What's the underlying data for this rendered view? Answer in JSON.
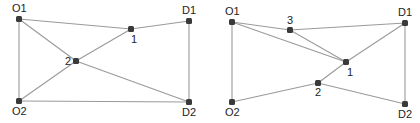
{
  "colors": {
    "edge": "#9a9a9a",
    "node": "#3a3a3a",
    "label": "#222222",
    "background": "#ffffff"
  },
  "diagrams": [
    {
      "id": "network-left",
      "nodes": [
        {
          "id": "O1",
          "label": "O1",
          "role": "origin"
        },
        {
          "id": "D1",
          "label": "D1",
          "role": "destination"
        },
        {
          "id": "1",
          "label": "1",
          "role": "intermediate"
        },
        {
          "id": "2",
          "label": "2",
          "role": "intermediate"
        },
        {
          "id": "O2",
          "label": "O2",
          "role": "origin"
        },
        {
          "id": "D2",
          "label": "D2",
          "role": "destination"
        }
      ],
      "edges": [
        [
          "O1",
          "1"
        ],
        [
          "1",
          "D1"
        ],
        [
          "O1",
          "2"
        ],
        [
          "2",
          "1"
        ],
        [
          "2",
          "O2"
        ],
        [
          "2",
          "D2"
        ],
        [
          "O1",
          "O2"
        ],
        [
          "D1",
          "D2"
        ],
        [
          "O2",
          "D2"
        ]
      ]
    },
    {
      "id": "network-right",
      "nodes": [
        {
          "id": "O1",
          "label": "O1",
          "role": "origin"
        },
        {
          "id": "D1",
          "label": "D1",
          "role": "destination"
        },
        {
          "id": "3",
          "label": "3",
          "role": "intermediate"
        },
        {
          "id": "1",
          "label": "1",
          "role": "intermediate"
        },
        {
          "id": "2",
          "label": "2",
          "role": "intermediate"
        },
        {
          "id": "O2",
          "label": "O2",
          "role": "origin"
        },
        {
          "id": "D2",
          "label": "D2",
          "role": "destination"
        }
      ],
      "edges": [
        [
          "O1",
          "3"
        ],
        [
          "3",
          "D1"
        ],
        [
          "O1",
          "1"
        ],
        [
          "3",
          "1"
        ],
        [
          "1",
          "D1"
        ],
        [
          "1",
          "2"
        ],
        [
          "2",
          "O2"
        ],
        [
          "2",
          "D2"
        ],
        [
          "O1",
          "O2"
        ],
        [
          "D1",
          "D2"
        ]
      ]
    }
  ]
}
